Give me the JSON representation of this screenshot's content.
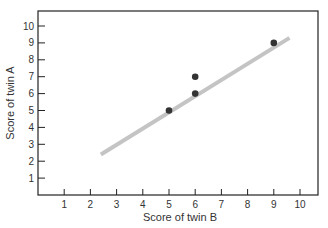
{
  "chart_data": {
    "type": "scatter",
    "title": "",
    "xlabel": "Score of twin B",
    "ylabel": "Score of twin A",
    "xlim": [
      0,
      10.5
    ],
    "ylim": [
      0,
      10.8
    ],
    "x_ticks": [
      "1",
      "2",
      "3",
      "4",
      "5",
      "6",
      "7",
      "8",
      "9",
      "10"
    ],
    "y_ticks": [
      "1",
      "2",
      "3",
      "4",
      "5",
      "6",
      "7",
      "8",
      "9",
      "10"
    ],
    "grid": false,
    "legend": null,
    "points": [
      {
        "x": 5,
        "y": 5
      },
      {
        "x": 6,
        "y": 6
      },
      {
        "x": 6,
        "y": 7
      },
      {
        "x": 9,
        "y": 9
      }
    ],
    "fit_line": {
      "x1": 2.4,
      "y1": 2.4,
      "x2": 9.6,
      "y2": 9.3,
      "color": "#c4c4c4"
    },
    "colors": {
      "point": "#333333",
      "axis": "#222222"
    }
  }
}
